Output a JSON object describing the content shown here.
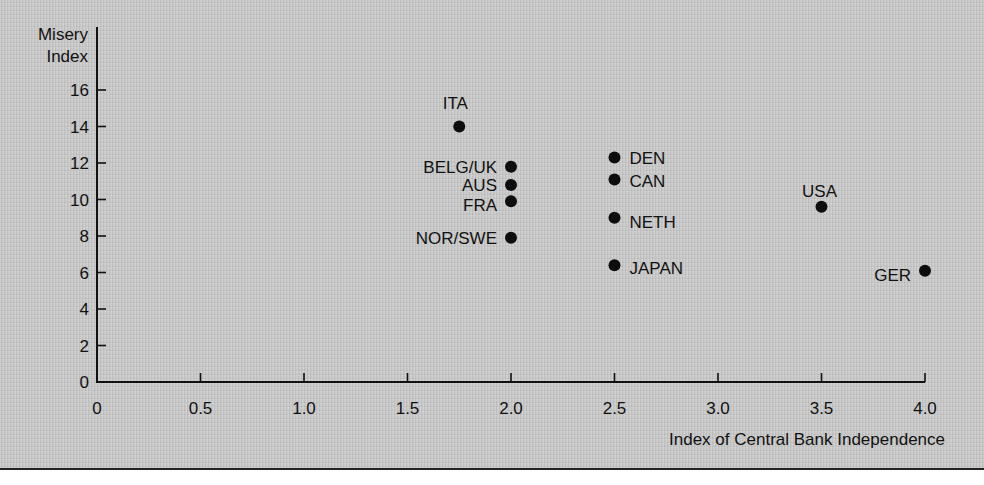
{
  "chart_data": {
    "type": "scatter",
    "title": "",
    "xlabel": "Index of Central Bank Independence",
    "ylabel": "Misery Index",
    "ylabel_lines": [
      "Misery",
      "Index"
    ],
    "xlim": [
      0,
      4.0
    ],
    "ylim": [
      0,
      16
    ],
    "x_ticks": [
      "0",
      "0.5",
      "1.0",
      "1.5",
      "2.0",
      "2.5",
      "3.0",
      "3.5",
      "4.0"
    ],
    "x_tick_values": [
      0,
      0.5,
      1.0,
      1.5,
      2.0,
      2.5,
      3.0,
      3.5,
      4.0
    ],
    "y_ticks": [
      "0",
      "2",
      "4",
      "6",
      "8",
      "10",
      "12",
      "14",
      "16"
    ],
    "y_tick_values": [
      0,
      2,
      4,
      6,
      8,
      10,
      12,
      14,
      16
    ],
    "grid": false,
    "legend": null,
    "points": [
      {
        "label": "ITA",
        "x": 1.75,
        "y": 14.0
      },
      {
        "label": "BELG/UK",
        "x": 2.0,
        "y": 11.8
      },
      {
        "label": "AUS",
        "x": 2.0,
        "y": 10.8
      },
      {
        "label": "FRA",
        "x": 2.0,
        "y": 9.9
      },
      {
        "label": "NOR/SWE",
        "x": 2.0,
        "y": 7.9
      },
      {
        "label": "DEN",
        "x": 2.5,
        "y": 12.3
      },
      {
        "label": "CAN",
        "x": 2.5,
        "y": 11.1
      },
      {
        "label": "NETH",
        "x": 2.5,
        "y": 9.0
      },
      {
        "label": "JAPAN",
        "x": 2.5,
        "y": 6.4
      },
      {
        "label": "USA",
        "x": 3.5,
        "y": 9.6
      },
      {
        "label": "GER",
        "x": 4.0,
        "y": 6.1
      }
    ],
    "colors": {
      "background": "#c9c9c9",
      "ink": "#111111"
    }
  }
}
